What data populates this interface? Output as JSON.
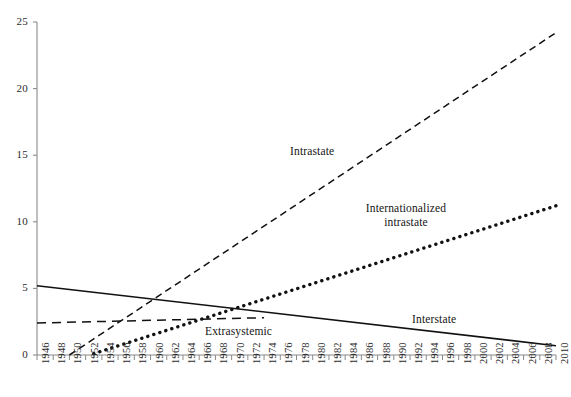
{
  "chart_data": {
    "type": "line",
    "title": "",
    "subtitle": "",
    "xlabel": "",
    "ylabel": "",
    "xlim": [
      1946,
      2010
    ],
    "ylim": [
      0,
      25
    ],
    "yticks": [
      0,
      5,
      10,
      15,
      20,
      25
    ],
    "grid": false,
    "legend_position": "inline-annotations",
    "x_tick_labels": [
      "1946",
      "1948",
      "1950",
      "1952",
      "1954",
      "1956",
      "1958",
      "1960",
      "1962",
      "1964",
      "1966",
      "1968",
      "1970",
      "1972",
      "1974",
      "1976",
      "1978",
      "1980",
      "1982",
      "1984",
      "1986",
      "1988",
      "1990",
      "1992",
      "1994",
      "1996",
      "1998",
      "2000",
      "2002",
      "2004",
      "2006",
      "2008",
      "2010"
    ],
    "y_tick_labels": [
      "0",
      "5",
      "10",
      "15",
      "20",
      "25"
    ],
    "series": [
      {
        "name": "Interstate",
        "style": "solid",
        "color": "#111111",
        "label_text": "Interstate",
        "x": [
          1946,
          2010
        ],
        "values": [
          5.2,
          0.7
        ]
      },
      {
        "name": "Intrastate",
        "style": "dashed",
        "color": "#111111",
        "label_text": "Intrastate",
        "x": [
          1950,
          2010
        ],
        "values": [
          0.0,
          24.2
        ]
      },
      {
        "name": "Internationalized intrastate",
        "style": "dotted",
        "color": "#111111",
        "label_line1": "Internationalized",
        "label_line2": "intrastate",
        "x": [
          1953,
          2010
        ],
        "values": [
          0.1,
          11.2
        ]
      },
      {
        "name": "Extrasystemic",
        "style": "dashed-short",
        "color": "#111111",
        "label_text": "Extrasystemic",
        "x": [
          1946,
          1974
        ],
        "values": [
          2.4,
          2.8
        ]
      }
    ]
  },
  "axis": {
    "y_axis_name": "y-axis",
    "x_axis_name": "x-axis"
  }
}
